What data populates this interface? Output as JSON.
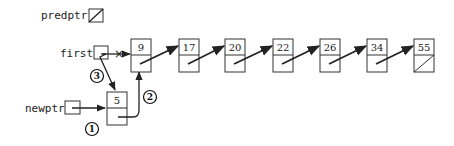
{
  "diagram": {
    "type": "linked-list-insertion-at-head",
    "pointers": {
      "predptr": {
        "label": "predptr",
        "value": "null"
      },
      "first": {
        "label": "first",
        "points_to_before": "9",
        "points_to_after": "5",
        "old_link_crossed_out": true
      },
      "newptr": {
        "label": "newptr",
        "points_to": "5"
      }
    },
    "new_node": {
      "value": "5",
      "next": "9"
    },
    "list_nodes": [
      {
        "value": "9"
      },
      {
        "value": "17"
      },
      {
        "value": "20"
      },
      {
        "value": "22"
      },
      {
        "value": "26"
      },
      {
        "value": "34"
      },
      {
        "value": "55",
        "next": "null"
      }
    ],
    "steps": [
      {
        "number": "1",
        "description": "newptr points to new node 5"
      },
      {
        "number": "2",
        "description": "new node's next points to node 9"
      },
      {
        "number": "3",
        "description": "first points to new node 5"
      }
    ],
    "cross_mark": "×"
  }
}
